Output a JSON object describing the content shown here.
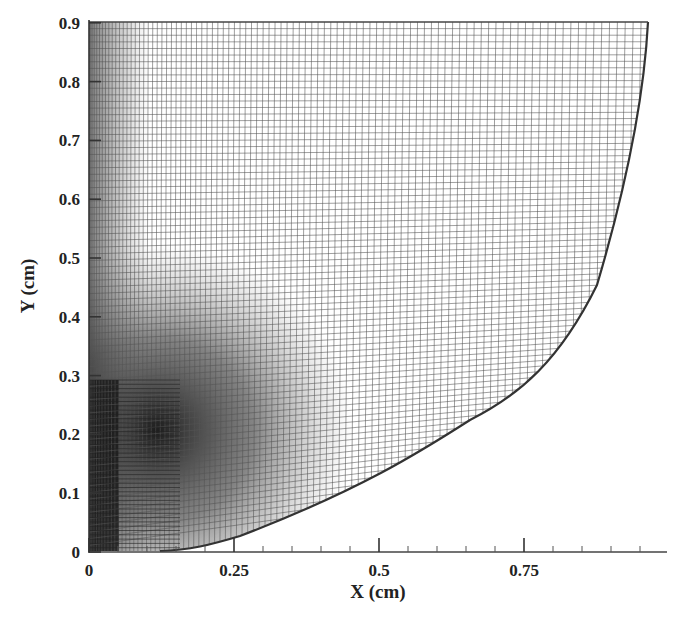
{
  "chart_data": {
    "type": "mesh",
    "title": "",
    "xlabel": "X (cm)",
    "ylabel": "Y (cm)",
    "xlim": [
      0,
      0.995
    ],
    "ylim": [
      0,
      0.9
    ],
    "x_ticks": [
      "0",
      "0.25",
      "0.5",
      "0.75"
    ],
    "x_tick_values": [
      0,
      0.25,
      0.5,
      0.75
    ],
    "y_ticks": [
      "0",
      "0.1",
      "0.2",
      "0.3",
      "0.4",
      "0.5",
      "0.6",
      "0.7",
      "0.8",
      "0.9"
    ],
    "y_tick_values": [
      0,
      0.1,
      0.2,
      0.3,
      0.4,
      0.5,
      0.6,
      0.7,
      0.8,
      0.9
    ],
    "grid": false,
    "legend": null,
    "boundary_curve": {
      "x": [
        0.96,
        0.95,
        0.92,
        0.875,
        0.71,
        0.535,
        0.415,
        0.26,
        0.15
      ],
      "y": [
        0.9,
        0.73,
        0.6,
        0.455,
        0.24,
        0.15,
        0.087,
        0.025,
        0.0
      ]
    },
    "refinement_region": {
      "x": [
        0.0,
        0.1
      ],
      "y": [
        0.0,
        0.35
      ]
    }
  },
  "colors": {
    "mesh": "#555555",
    "boundary": "#333333",
    "dense_region": "#1a1a1a",
    "background": "#ffffff"
  }
}
